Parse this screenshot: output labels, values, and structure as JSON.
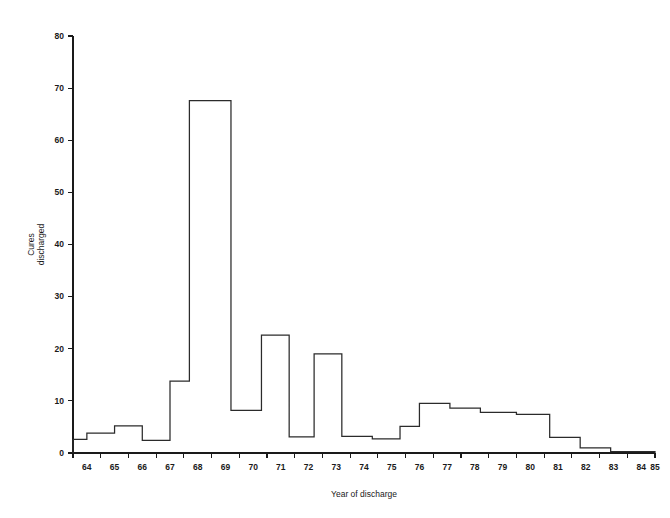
{
  "chart_data": {
    "type": "line",
    "subtype": "step-histogram",
    "title": "",
    "subtitle": "",
    "xlabel": "Year of discharge",
    "ylabel": "Cures discharged",
    "ylabel_lines": [
      "Cures",
      "discharged"
    ],
    "xlim": [
      64,
      85
    ],
    "ylim": [
      0,
      80
    ],
    "ytick_labels": [
      "0",
      "10",
      "20",
      "30",
      "40",
      "50",
      "60",
      "70",
      "80"
    ],
    "yticks": [
      0,
      10,
      20,
      30,
      40,
      50,
      60,
      70,
      80
    ],
    "xtick_labels": [
      "64",
      "65",
      "66",
      "67",
      "68",
      "69",
      "70",
      "71",
      "72",
      "73",
      "74",
      "75",
      "76",
      "77",
      "78",
      "79",
      "80",
      "81",
      "82",
      "83",
      "84",
      "85"
    ],
    "xticks": [
      64,
      65,
      66,
      67,
      68,
      69,
      70,
      71,
      72,
      73,
      74,
      75,
      76,
      77,
      78,
      79,
      80,
      81,
      82,
      83,
      84,
      85
    ],
    "grid": false,
    "legend": false,
    "line_color": "#2b2b2b",
    "axis_color": "#1a1a1a",
    "background_color": "#ffffff",
    "steps": [
      {
        "x_start": 64.0,
        "x_end": 64.5,
        "value": 2.6
      },
      {
        "x_start": 64.5,
        "x_end": 65.5,
        "value": 3.8
      },
      {
        "x_start": 65.5,
        "x_end": 66.5,
        "value": 5.2
      },
      {
        "x_start": 66.5,
        "x_end": 67.5,
        "value": 2.4
      },
      {
        "x_start": 67.5,
        "x_end": 68.2,
        "value": 13.8
      },
      {
        "x_start": 68.2,
        "x_end": 69.7,
        "value": 67.6
      },
      {
        "x_start": 69.7,
        "x_end": 70.8,
        "value": 8.2
      },
      {
        "x_start": 70.8,
        "x_end": 71.8,
        "value": 22.6
      },
      {
        "x_start": 71.8,
        "x_end": 72.7,
        "value": 3.1
      },
      {
        "x_start": 72.7,
        "x_end": 73.7,
        "value": 19.0
      },
      {
        "x_start": 73.7,
        "x_end": 74.8,
        "value": 3.2
      },
      {
        "x_start": 74.8,
        "x_end": 75.8,
        "value": 2.7
      },
      {
        "x_start": 75.8,
        "x_end": 76.5,
        "value": 5.1
      },
      {
        "x_start": 76.5,
        "x_end": 77.6,
        "value": 9.5
      },
      {
        "x_start": 77.6,
        "x_end": 78.7,
        "value": 8.6
      },
      {
        "x_start": 78.7,
        "x_end": 80.0,
        "value": 7.8
      },
      {
        "x_start": 80.0,
        "x_end": 81.2,
        "value": 7.4
      },
      {
        "x_start": 81.2,
        "x_end": 82.3,
        "value": 3.0
      },
      {
        "x_start": 82.3,
        "x_end": 83.4,
        "value": 1.0
      },
      {
        "x_start": 83.4,
        "x_end": 85.0,
        "value": 0.25
      }
    ],
    "categories": [
      "64",
      "65",
      "66",
      "67",
      "68",
      "69",
      "70",
      "71",
      "72",
      "73",
      "74",
      "75",
      "76",
      "77",
      "78",
      "79",
      "80",
      "81",
      "82",
      "83",
      "84"
    ],
    "values": [
      2.6,
      3.8,
      5.2,
      2.4,
      13.8,
      67.6,
      8.2,
      22.6,
      3.1,
      19.0,
      3.2,
      2.7,
      5.1,
      9.5,
      8.6,
      7.8,
      7.4,
      3.0,
      1.0,
      0.25,
      0
    ]
  }
}
